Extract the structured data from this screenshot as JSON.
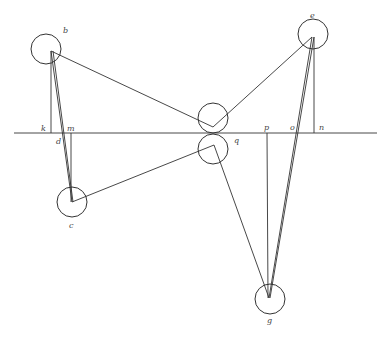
{
  "diagram": {
    "type": "geometric-construction",
    "labels": {
      "b": "b",
      "c": "c",
      "d": "d",
      "e": "e",
      "g": "g",
      "k": "k",
      "m": "m",
      "n": "n",
      "o": "o",
      "p": "p",
      "q": "q"
    },
    "colors": {
      "stroke": "#333333",
      "label": "#444444",
      "background": "#ffffff"
    }
  }
}
